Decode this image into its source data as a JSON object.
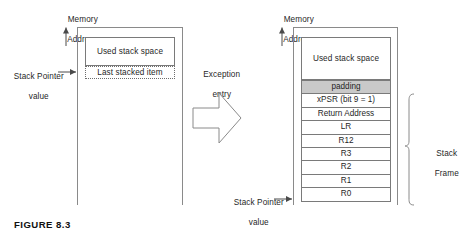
{
  "figure": {
    "caption": "FIGURE 8.3",
    "axis_label_line1": "Memory",
    "axis_label_line2": "Address"
  },
  "before": {
    "axis_label_line1": "Memory",
    "axis_label_line2": "Address",
    "sp_label_line1": "Stack Pointer",
    "sp_label_line2": "value",
    "used_stack_space": "Used stack space",
    "last_stacked_item": "Last stacked item"
  },
  "transition": {
    "label_line1": "Exception",
    "label_line2": "entry",
    "arrow_icon": "block-arrow-right-icon"
  },
  "after": {
    "axis_label_line1": "Memory",
    "axis_label_line2": "Address",
    "sp_label_line1": "Stack Pointer",
    "sp_label_line2": "value",
    "used_stack_space": "Used stack space",
    "bracket_label_line1": "Stack",
    "bracket_label_line2": "Frame",
    "rows": [
      {
        "label": "padding",
        "shaded": true
      },
      {
        "label": "xPSR (bit 9 = 1)",
        "shaded": false
      },
      {
        "label": "Return Address",
        "shaded": false
      },
      {
        "label": "LR",
        "shaded": false
      },
      {
        "label": "R12",
        "shaded": false
      },
      {
        "label": "R3",
        "shaded": false
      },
      {
        "label": "R2",
        "shaded": false
      },
      {
        "label": "R1",
        "shaded": false
      },
      {
        "label": "R0",
        "shaded": false
      }
    ]
  },
  "colors": {
    "line": "#7a7a7a",
    "rule": "#8a8a8a",
    "shade": "#c9c9c9",
    "text": "#1f1f1f",
    "background": "#ffffff"
  }
}
